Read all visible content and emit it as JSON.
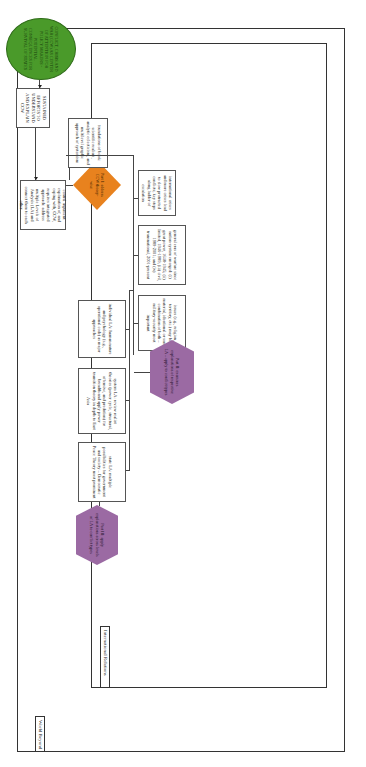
{
  "frames": {
    "outer_label": "World Beyond",
    "inner_label": "International Relations"
  },
  "nodes": {
    "start": "CONFLICT, CRISIS AND WAR (CCW) AS CENTER OF ATTENTION FOR POLICY MAKERS - POTENTIAL CONSEQUENCES FOR SURVIVAL OF STATES",
    "sustained": "SUSTAINED EFFORTS TO UNDERSTAND AND EXPLAIN CCW",
    "central_argument": "central argument: explanation of, and coping with, CCW, requires integrated approach: address multiple Levels of Analysis (LA) and connect them to each other",
    "foundations": "foundations of book: scientific realism, analytic eclecticism, and multilevel graphic approach of systemism",
    "part1": "Part I: address CCW theory-wise",
    "crises": "international crises and more crises lead to slow protracted conflicts; key steps along ladder of escalation",
    "eras": "general eras of warfare since nation-system emerged: (i) great power, 1648-1945; (ii) limited, 1946-1989; (iii) civil, 1989-2001; and (iv) transnational, 2001-present",
    "issues": "issues (e.g., religion, territory, etc.) may be material, ideational or some combination of both – military-security most important",
    "part2": "Part II: examines explanations of respective LA – apply to conflict types",
    "individual": "individual LA: human nature and psychology (e.g., operational code) as major approaches",
    "system": "system LA: review realist theories (power cycle, structural, offensive, and predation) for breadth and apply power transition theory in depth to East Asia",
    "state": "state LA: multiple possibilities for government and society – Democratic Peace Theory most prominent",
    "part3": "Part III: apply explanations across levels of LA to conflict types"
  },
  "colors": {
    "start_fill": "#4a9a2a",
    "part_fill": "#9b6aa3",
    "part1_fill": "#e8821e"
  }
}
